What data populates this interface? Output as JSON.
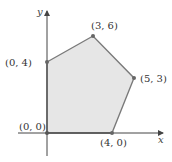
{
  "diagram": {
    "type": "feasible-region-polygon",
    "axes": {
      "x_label": "x",
      "y_label": "y"
    },
    "colors": {
      "fill": "#e6e6e6",
      "edge": "#7a7a7a",
      "axis": "#444444",
      "vertex": "#666666"
    },
    "vertices": [
      {
        "label": "(0, 0)",
        "x": 0,
        "y": 0
      },
      {
        "label": "(0, 4)",
        "x": 0,
        "y": 4
      },
      {
        "label": "(3, 6)",
        "x": 3,
        "y": 6
      },
      {
        "label": "(5, 3)",
        "x": 5,
        "y": 3
      },
      {
        "label": "(4, 0)",
        "x": 4,
        "y": 0
      }
    ]
  }
}
